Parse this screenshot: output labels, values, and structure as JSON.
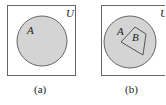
{
  "diagrams": [
    {
      "universe_label": "U",
      "set_labels": [
        "A"
      ],
      "caption": "(a)"
    },
    {
      "universe_label": "U",
      "set_labels": [
        "A",
        "B"
      ],
      "caption": "(b)"
    }
  ],
  "colors": {
    "fill": "#d4d4d4",
    "stroke": "#555555"
  }
}
